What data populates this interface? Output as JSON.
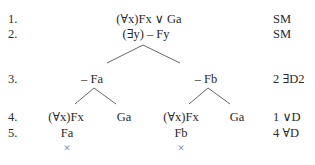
{
  "tree": {
    "line_numbers": [
      "1.",
      "2.",
      "3.",
      "4.",
      "5."
    ],
    "premises": {
      "line1": "(∀x)Fx ∨ Ga",
      "line2": "(∃y) – Fy"
    },
    "branches": {
      "left": {
        "line3": "– Fa",
        "line4_left": "(∀x)Fx",
        "line4_right": "Ga",
        "line5": "Fa",
        "closed_mark": "×"
      },
      "right": {
        "line3": "– Fb",
        "line4_left": "(∀x)Fx",
        "line4_right": "Ga",
        "line5": "Fb",
        "closed_mark": "×"
      }
    },
    "justifications": {
      "line1": "SM",
      "line2": "SM",
      "line3": "2 ∃D2",
      "line4": "1 ∨D",
      "line5": "4 ∀D"
    }
  }
}
